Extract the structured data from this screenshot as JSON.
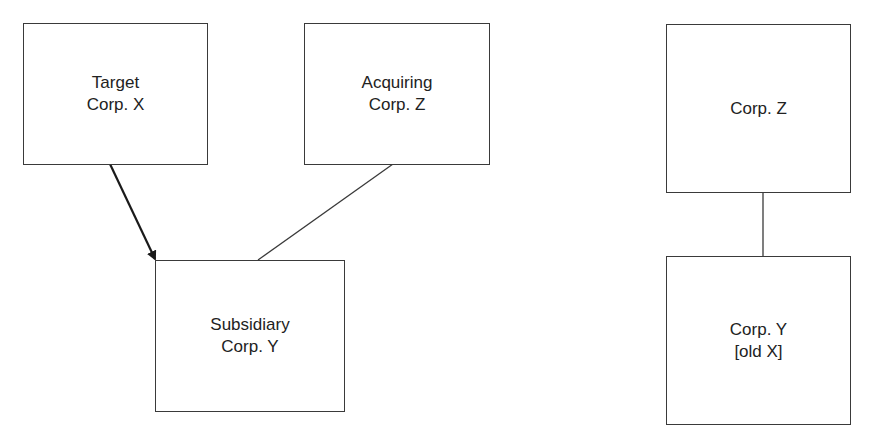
{
  "diagram": {
    "before": {
      "boxes": [
        {
          "id": "target",
          "lines": [
            "Target",
            "Corp. X"
          ]
        },
        {
          "id": "acquiring",
          "lines": [
            "Acquiring",
            "Corp. Z"
          ]
        },
        {
          "id": "subsidiary",
          "lines": [
            "Subsidiary",
            "Corp. Y"
          ]
        }
      ],
      "edges": [
        {
          "from": "target",
          "to": "subsidiary",
          "style": "arrow"
        },
        {
          "from": "acquiring",
          "to": "subsidiary",
          "style": "line"
        }
      ]
    },
    "after": {
      "boxes": [
        {
          "id": "corp-z",
          "lines": [
            "Corp. Z"
          ]
        },
        {
          "id": "corp-y",
          "lines": [
            "Corp. Y",
            "[old X]"
          ]
        }
      ],
      "edges": [
        {
          "from": "corp-z",
          "to": "corp-y",
          "style": "line"
        }
      ]
    }
  },
  "colors": {
    "stroke": "#3a3a3a",
    "text": "#222222",
    "background": "#ffffff"
  }
}
